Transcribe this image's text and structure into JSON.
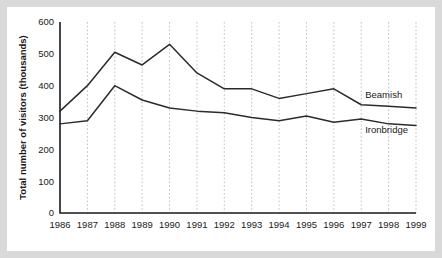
{
  "chart_data": {
    "type": "line",
    "title": "",
    "xlabel": "",
    "ylabel": "Total number of visitors (thousands)",
    "categories": [
      "1986",
      "1987",
      "1988",
      "1989",
      "1990",
      "1991",
      "1992",
      "1993",
      "1994",
      "1995",
      "1996",
      "1997",
      "1998",
      "1999"
    ],
    "ylim": [
      0,
      600
    ],
    "ytick_values": [
      0,
      100,
      200,
      300,
      400,
      500,
      600
    ],
    "ytick_labels": [
      "0",
      "100",
      "200",
      "300",
      "400",
      "500",
      "600"
    ],
    "grid": "vertical-dashed",
    "legend_position": "inline-right",
    "series": [
      {
        "name": "Beamish",
        "label": "Beamish",
        "color": "#2b2b2b",
        "values": [
          320,
          400,
          505,
          465,
          530,
          440,
          390,
          390,
          360,
          375,
          390,
          340,
          335,
          330
        ]
      },
      {
        "name": "Ironbridge",
        "label": "Ironbridge",
        "color": "#2b2b2b",
        "values": [
          280,
          290,
          400,
          355,
          330,
          320,
          315,
          300,
          290,
          305,
          285,
          295,
          280,
          275
        ]
      }
    ]
  },
  "labels": {
    "y_axis_title": "Total number of visitors (thousands)",
    "series_beamish": "Beamish",
    "series_ironbridge": "Ironbridge",
    "y_0": "0",
    "y_100": "100",
    "y_200": "200",
    "y_300": "300",
    "y_400": "400",
    "y_500": "500",
    "y_600": "600",
    "x_1986": "1986",
    "x_1987": "1987",
    "x_1988": "1988",
    "x_1989": "1989",
    "x_1990": "1990",
    "x_1991": "1991",
    "x_1992": "1992",
    "x_1993": "1993",
    "x_1994": "1994",
    "x_1995": "1995",
    "x_1996": "1996",
    "x_1997": "1997",
    "x_1998": "1998",
    "x_1999": "1999"
  }
}
